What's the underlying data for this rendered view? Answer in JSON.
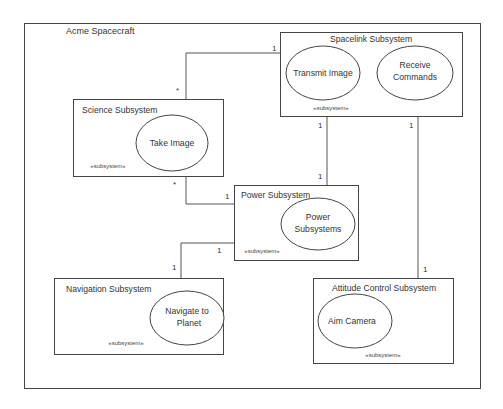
{
  "diagram": {
    "title": "Acme Spacecraft",
    "stereotype": "«subsystem»",
    "subsystems": [
      {
        "id": "spacelink",
        "name": "Spacelink Subsystem",
        "use_cases": [
          "Transmit Image",
          "Receive Commands"
        ]
      },
      {
        "id": "science",
        "name": "Science Subsystem",
        "use_cases": [
          "Take Image"
        ]
      },
      {
        "id": "power",
        "name": "Power Subsystem",
        "use_cases": [
          "Power Subsystems"
        ]
      },
      {
        "id": "navigation",
        "name": "Navigation Subsystem",
        "use_cases": [
          "Navigate to Planet"
        ]
      },
      {
        "id": "attitude",
        "name": "Attitude Control Subsystem",
        "use_cases": [
          "Aim Camera"
        ]
      }
    ],
    "use_case_lines": {
      "transmit_image": "Transmit Image",
      "receive_1": "Receive",
      "receive_2": "Commands",
      "take_image": "Take Image",
      "power_1": "Power",
      "power_2": "Subsystems",
      "navigate_1": "Navigate to",
      "navigate_2": "Planet",
      "aim_camera": "Aim Camera"
    },
    "associations": [
      {
        "from": "Science Subsystem",
        "to": "Spacelink Subsystem",
        "from_mult": "*",
        "to_mult": "1"
      },
      {
        "from": "Science Subsystem",
        "to": "Power Subsystem",
        "from_mult": "*",
        "to_mult": "1"
      },
      {
        "from": "Spacelink Subsystem",
        "to": "Power Subsystem",
        "from_mult": "1",
        "to_mult": "1"
      },
      {
        "from": "Spacelink Subsystem",
        "to": "Attitude Control Subsystem",
        "from_mult": "1",
        "to_mult": "1"
      },
      {
        "from": "Power Subsystem",
        "to": "Navigation Subsystem",
        "from_mult": "1",
        "to_mult": "1"
      }
    ]
  }
}
